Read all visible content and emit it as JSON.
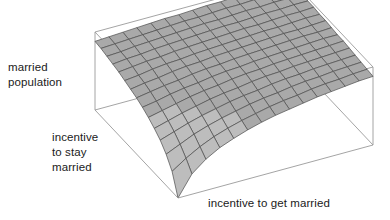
{
  "figure": {
    "background_color": "#ffffff",
    "text_color": "#1a1a1a"
  },
  "chart_data": {
    "type": "surface",
    "title": "",
    "xlabel": "incentive to get married",
    "ylabel": "incentive to stay married",
    "zlabel": "married population",
    "grid": true,
    "legend": "none",
    "surface_color": "#a9a9a9",
    "surface_color_left": "#bdbdbd",
    "gridline_color": "#4d4d4d",
    "box_color": "#9a9a9a",
    "nx": 14,
    "ny": 14,
    "xlim": [
      0,
      1
    ],
    "ylim": [
      0,
      1
    ],
    "zlim": [
      0,
      1
    ],
    "z_values": [
      [
        0.0,
        0.26,
        0.4,
        0.5,
        0.57,
        0.63,
        0.68,
        0.72,
        0.75,
        0.78,
        0.81,
        0.83,
        0.85,
        0.87,
        0.88
      ],
      [
        0.26,
        0.38,
        0.48,
        0.56,
        0.62,
        0.67,
        0.71,
        0.75,
        0.78,
        0.8,
        0.83,
        0.85,
        0.86,
        0.88,
        0.89
      ],
      [
        0.4,
        0.48,
        0.56,
        0.62,
        0.67,
        0.71,
        0.75,
        0.78,
        0.8,
        0.83,
        0.85,
        0.86,
        0.88,
        0.89,
        0.9
      ],
      [
        0.5,
        0.56,
        0.62,
        0.67,
        0.71,
        0.75,
        0.78,
        0.8,
        0.83,
        0.85,
        0.86,
        0.88,
        0.89,
        0.9,
        0.91
      ],
      [
        0.57,
        0.62,
        0.67,
        0.71,
        0.75,
        0.78,
        0.8,
        0.83,
        0.85,
        0.86,
        0.88,
        0.89,
        0.9,
        0.91,
        0.92
      ],
      [
        0.63,
        0.67,
        0.71,
        0.75,
        0.78,
        0.8,
        0.83,
        0.85,
        0.86,
        0.88,
        0.89,
        0.9,
        0.91,
        0.92,
        0.93
      ],
      [
        0.68,
        0.71,
        0.75,
        0.78,
        0.8,
        0.83,
        0.85,
        0.86,
        0.88,
        0.89,
        0.9,
        0.91,
        0.92,
        0.93,
        0.93
      ],
      [
        0.72,
        0.75,
        0.78,
        0.8,
        0.83,
        0.85,
        0.86,
        0.88,
        0.89,
        0.9,
        0.91,
        0.92,
        0.93,
        0.93,
        0.94
      ],
      [
        0.75,
        0.78,
        0.8,
        0.83,
        0.85,
        0.86,
        0.88,
        0.89,
        0.9,
        0.91,
        0.92,
        0.93,
        0.93,
        0.94,
        0.95
      ],
      [
        0.78,
        0.8,
        0.83,
        0.85,
        0.86,
        0.88,
        0.89,
        0.9,
        0.91,
        0.92,
        0.93,
        0.93,
        0.94,
        0.95,
        0.95
      ],
      [
        0.81,
        0.83,
        0.85,
        0.86,
        0.88,
        0.89,
        0.9,
        0.91,
        0.92,
        0.93,
        0.93,
        0.94,
        0.95,
        0.95,
        0.96
      ],
      [
        0.83,
        0.85,
        0.86,
        0.88,
        0.89,
        0.9,
        0.91,
        0.92,
        0.93,
        0.93,
        0.94,
        0.95,
        0.95,
        0.96,
        0.96
      ],
      [
        0.85,
        0.86,
        0.88,
        0.89,
        0.9,
        0.91,
        0.92,
        0.93,
        0.93,
        0.94,
        0.95,
        0.95,
        0.96,
        0.96,
        0.97
      ],
      [
        0.87,
        0.88,
        0.89,
        0.9,
        0.91,
        0.92,
        0.93,
        0.93,
        0.94,
        0.95,
        0.95,
        0.96,
        0.96,
        0.97,
        0.97
      ],
      [
        0.88,
        0.89,
        0.9,
        0.91,
        0.92,
        0.93,
        0.93,
        0.94,
        0.95,
        0.95,
        0.96,
        0.96,
        0.97,
        0.97,
        0.98
      ]
    ]
  },
  "labels": {
    "z_line1": "married",
    "z_line2": "population",
    "y_line1": "incentive",
    "y_line2": "to stay",
    "y_line3": "married",
    "x_line1": "incentive to get married"
  }
}
